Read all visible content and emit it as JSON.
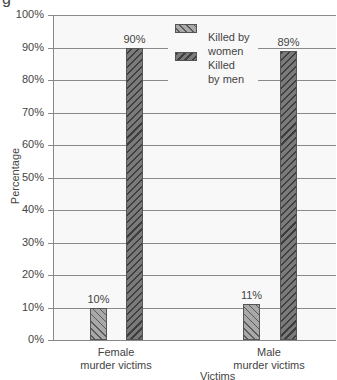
{
  "title_fragment": "g",
  "chart_data": {
    "type": "bar",
    "title": "",
    "xlabel": "Victims",
    "ylabel": "Percentage",
    "ylim": [
      0,
      100
    ],
    "yticks": [
      "0%",
      "10%",
      "20%",
      "30%",
      "40%",
      "50%",
      "60%",
      "70%",
      "80%",
      "90%",
      "100%"
    ],
    "grid": true,
    "legend_position": "upper center",
    "categories": [
      "Female\nmurder victims",
      "Male\nmurder victims"
    ],
    "category_lines": [
      [
        "Female",
        "murder victims"
      ],
      [
        "Male",
        "murder victims"
      ]
    ],
    "series": [
      {
        "name": "Killed by women",
        "values": [
          10,
          11
        ],
        "labels": [
          "10%",
          "11%"
        ],
        "pattern": "forward-hatch",
        "color": "#a8a8a8"
      },
      {
        "name": "Killed by men",
        "values": [
          90,
          89
        ],
        "labels": [
          "90%",
          "89%"
        ],
        "pattern": "back-hatch",
        "color": "#7a7a7a"
      }
    ]
  },
  "legend": {
    "items": [
      {
        "line1": "Killed by",
        "line2": "women"
      },
      {
        "line1": "Killed",
        "line2": "by men"
      }
    ]
  }
}
